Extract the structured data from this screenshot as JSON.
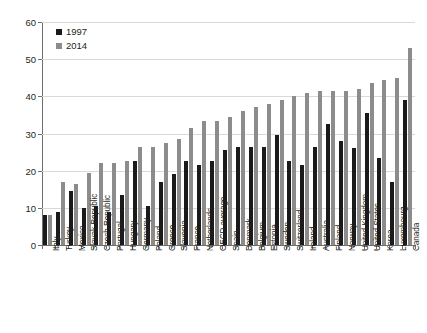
{
  "chart_data": {
    "type": "bar",
    "title": "",
    "subtitle": "",
    "xlabel": "",
    "ylabel": "",
    "ylim": [
      0,
      60
    ],
    "yticks": [
      0,
      10,
      20,
      30,
      40,
      50,
      60
    ],
    "grid": true,
    "legend_position": "top-left",
    "categories": [
      "Italy",
      "Turkey",
      "Mexico",
      "Slovak Republic",
      "Czech Republic",
      "Portugal",
      "Hungary",
      "Germany",
      "Poland",
      "Greece",
      "Slovenia",
      "France",
      "Netherlands",
      "OECD average",
      "Spain",
      "Denmark",
      "Belgium",
      "Estonia",
      "Sweden",
      "Switzerland",
      "Ireland",
      "Australia",
      "Finland",
      "Norway",
      "United Kingdom",
      "United States",
      "Korea",
      "Luxembourg",
      "Canada"
    ],
    "series": [
      {
        "name": "1997",
        "color": "#1a1a1a",
        "values": [
          8,
          9,
          14.5,
          10,
          10.5,
          9,
          13.5,
          22.5,
          10.5,
          17,
          19,
          22.5,
          21.5,
          22.5,
          25.5,
          26.5,
          26.5,
          26.5,
          29.5,
          22.5,
          21.5,
          26.5,
          32.5,
          28,
          26,
          35.5,
          23.5,
          17,
          39
        ]
      },
      {
        "name": "2014",
        "color": "#8c8c8c",
        "values": [
          8,
          17,
          16.5,
          19.5,
          22,
          22,
          22.5,
          26.5,
          26.5,
          27.5,
          28.5,
          31.5,
          33.5,
          33.5,
          34.5,
          36,
          37,
          38,
          39,
          40,
          41,
          41.5,
          41.5,
          41.5,
          42,
          43.5,
          44.5,
          45,
          53
        ]
      }
    ]
  },
  "legend": {
    "items": [
      {
        "label": "1997",
        "color": "#1a1a1a"
      },
      {
        "label": "2014",
        "color": "#8c8c8c"
      }
    ]
  }
}
